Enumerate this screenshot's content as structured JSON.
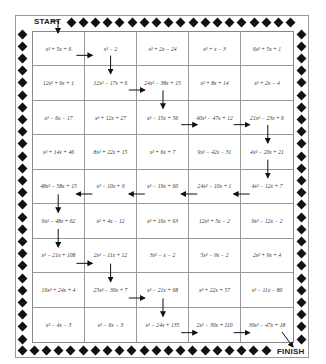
{
  "maze": {
    "start_label": "START",
    "finish_label": "FINISH",
    "rows": [
      [
        "x² + 5x + 6",
        "x² − 2",
        "x² + 2x − 24",
        "x² + x − 3",
        "6x² + 5x + 1"
      ],
      [
        "12x² + 9x + 1",
        "12x² − 17x + 6",
        "24x² − 38x + 15",
        "x² + 8x + 14",
        "x² + 2x − 4"
      ],
      [
        "x² − 6x − 17",
        "x² + 12x + 27",
        "x² − 15x + 56",
        "40x² − 47x + 12",
        "21x² − 23x + 6"
      ],
      [
        "x² + 14x + 46",
        "8x² + 22x + 15",
        "x² + 6x + 7",
        "9x² − 42x − 31",
        "4x² − 20x + 21"
      ],
      [
        "48x² − 58x + 15",
        "x² − 10x + 9",
        "x² − 19x + 60",
        "24x² − 10x + 1",
        "4x² − 12x + 7"
      ],
      [
        "9x² − 48x + 62",
        "x² + 4x − 12",
        "x² + 16x + 63",
        "12x² + 5x − 2",
        "9x² − 12x − 2"
      ],
      [
        "x² − 21x + 108",
        "2x² − 11x + 12",
        "3x² − x − 2",
        "5x² − 9x − 2",
        "2x² + 9x + 4"
      ],
      [
        "16x² + 24x + 4",
        "25x² − 30x + 7",
        "x² − 21x + 68",
        "x² + 22x + 57",
        "x² − 11x − 80"
      ],
      [
        "x² − 4x − 3",
        "x² − 6x − 3",
        "x² − 24x + 135",
        "2x² − 30x + 110",
        "30x² − 47x + 18"
      ]
    ],
    "path_arrows": [
      {
        "from": [
          0,
          0
        ],
        "to": [
          0,
          1
        ],
        "dir": "right"
      },
      {
        "from": [
          0,
          1
        ],
        "to": [
          1,
          1
        ],
        "dir": "down"
      },
      {
        "from": [
          1,
          1
        ],
        "to": [
          1,
          2
        ],
        "dir": "right"
      },
      {
        "from": [
          1,
          2
        ],
        "to": [
          2,
          2
        ],
        "dir": "down"
      },
      {
        "from": [
          2,
          2
        ],
        "to": [
          2,
          3
        ],
        "dir": "right"
      },
      {
        "from": [
          2,
          3
        ],
        "to": [
          2,
          4
        ],
        "dir": "right"
      },
      {
        "from": [
          2,
          4
        ],
        "to": [
          3,
          4
        ],
        "dir": "down"
      },
      {
        "from": [
          3,
          4
        ],
        "to": [
          4,
          4
        ],
        "dir": "down"
      },
      {
        "from": [
          4,
          4
        ],
        "to": [
          4,
          3
        ],
        "dir": "left"
      },
      {
        "from": [
          4,
          3
        ],
        "to": [
          4,
          2
        ],
        "dir": "left"
      },
      {
        "from": [
          4,
          2
        ],
        "to": [
          4,
          1
        ],
        "dir": "left"
      },
      {
        "from": [
          4,
          1
        ],
        "to": [
          4,
          0
        ],
        "dir": "left"
      },
      {
        "from": [
          4,
          0
        ],
        "to": [
          5,
          0
        ],
        "dir": "down"
      },
      {
        "from": [
          5,
          0
        ],
        "to": [
          6,
          0
        ],
        "dir": "down"
      },
      {
        "from": [
          6,
          0
        ],
        "to": [
          6,
          1
        ],
        "dir": "right"
      },
      {
        "from": [
          6,
          1
        ],
        "to": [
          7,
          1
        ],
        "dir": "down"
      },
      {
        "from": [
          7,
          1
        ],
        "to": [
          7,
          2
        ],
        "dir": "right"
      },
      {
        "from": [
          7,
          2
        ],
        "to": [
          8,
          2
        ],
        "dir": "down"
      },
      {
        "from": [
          8,
          2
        ],
        "to": [
          8,
          3
        ],
        "dir": "right"
      },
      {
        "from": [
          8,
          3
        ],
        "to": [
          8,
          4
        ],
        "dir": "right"
      }
    ],
    "colors": {
      "border": "#9a9a9a",
      "ink": "#111111"
    }
  }
}
